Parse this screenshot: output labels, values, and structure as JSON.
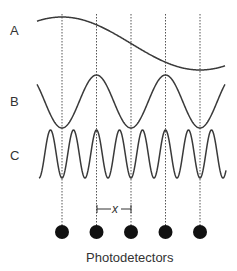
{
  "diagram": {
    "curve_labels": [
      "A",
      "B",
      "C"
    ],
    "spacing_label": "x",
    "caption": "Photodetectors",
    "detector_count": 5,
    "colors": {
      "line": "#3a3a3a",
      "detector": "#111111",
      "text": "#333333"
    }
  }
}
